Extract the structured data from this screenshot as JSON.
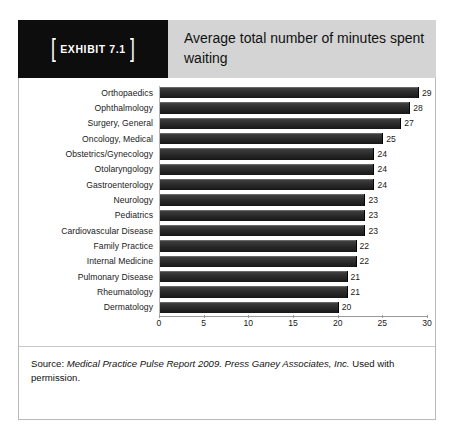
{
  "exhibit": {
    "badge_bracket_left": "[",
    "badge_bracket_right": "]",
    "badge_label": "EXHIBIT 7.1",
    "title": "Average total number of minutes spent waiting",
    "badge_bg": "#0d0d0d",
    "title_bg": "#d4d4d4",
    "bar_color": "#2b2b2b"
  },
  "source": {
    "prefix": "Source: ",
    "italic_part": "Medical Practice Pulse Report 2009. Press Ganey Associates, Inc.",
    "suffix": " Used with permission."
  },
  "chart_data": {
    "type": "bar",
    "orientation": "horizontal",
    "title": "Average total number of minutes spent waiting",
    "xlabel": "",
    "ylabel": "",
    "xlim": [
      0,
      30
    ],
    "xticks": [
      0,
      5,
      10,
      15,
      20,
      25,
      30
    ],
    "grid": false,
    "legend": false,
    "data_labels": true,
    "categories": [
      "Orthopaedics",
      "Ophthalmology",
      "Surgery, General",
      "Oncology, Medical",
      "Obstetrics/Gynecology",
      "Otolaryngology",
      "Gastroenterology",
      "Neurology",
      "Pediatrics",
      "Cardiovascular Disease",
      "Family Practice",
      "Internal Medicine",
      "Pulmonary Disease",
      "Rheumatology",
      "Dermatology"
    ],
    "values": [
      29,
      28,
      27,
      25,
      24,
      24,
      24,
      23,
      23,
      23,
      22,
      22,
      21,
      21,
      20
    ]
  }
}
